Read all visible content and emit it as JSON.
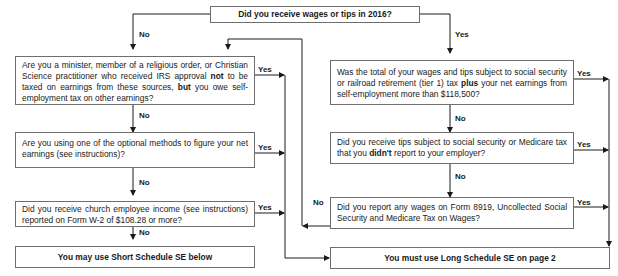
{
  "start": {
    "question": "Did you receive wages or tips in 2016?"
  },
  "left_branch": {
    "entry_label": "No",
    "questions": [
      {
        "id": "q_minister",
        "parts": [
          "Are you a minister, member of a religious order, or Christian Science practitioner who received IRS approval ",
          "not",
          " to be taxed on earnings from these sources, ",
          "but",
          " you owe self-employment tax on other earnings?"
        ],
        "yes_label": "Yes",
        "no_label": "No"
      },
      {
        "id": "q_optional",
        "parts": [
          "Are you using one of the optional methods to figure your net earnings (see instructions)?"
        ],
        "yes_label": "Yes",
        "no_label": "No"
      },
      {
        "id": "q_church",
        "parts": [
          "Did you receive church employee income (see instructions) reported on Form W-2 of $108.28 or more?"
        ],
        "yes_label": "Yes",
        "no_label": "No"
      }
    ],
    "result": "You may use Short Schedule SE below"
  },
  "right_branch": {
    "entry_label": "Yes",
    "questions": [
      {
        "id": "q_total_wages",
        "parts": [
          "Was the total of your wages and tips subject to social security or railroad retirement (tier 1) tax ",
          "plus",
          " your net earnings from self-employment more than $118,500?"
        ],
        "yes_label": "Yes",
        "no_label": "No"
      },
      {
        "id": "q_tips",
        "parts": [
          "Did you receive tips subject to social security or Medicare tax that you ",
          "didn't",
          " report to your employer?"
        ],
        "yes_label": "Yes",
        "no_label": "No"
      },
      {
        "id": "q_form8919",
        "parts": [
          "Did you report any wages on Form 8919, Uncollected Social Security and Medicare Tax on Wages?"
        ],
        "yes_label": "Yes",
        "no_label": "No"
      }
    ],
    "result": "You must use Long Schedule SE on page 2"
  },
  "colors": {
    "line": "#1a1a1a",
    "box_border": "#6e6e6e",
    "background": "#ffffff"
  }
}
